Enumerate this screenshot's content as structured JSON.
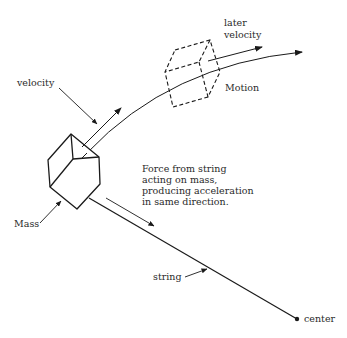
{
  "diagram": {
    "labels": {
      "velocity": "velocity",
      "later_velocity_line1": "later",
      "later_velocity_line2": "velocity",
      "motion": "Motion",
      "mass": "Mass",
      "string": "string",
      "center": "center",
      "force_line1": "Force from string",
      "force_line2": "acting on mass,",
      "force_line3": "producing acceleration",
      "force_line4": "in same direction."
    },
    "colors": {
      "ink": "#1a1a1a",
      "background": "#ffffff"
    }
  }
}
